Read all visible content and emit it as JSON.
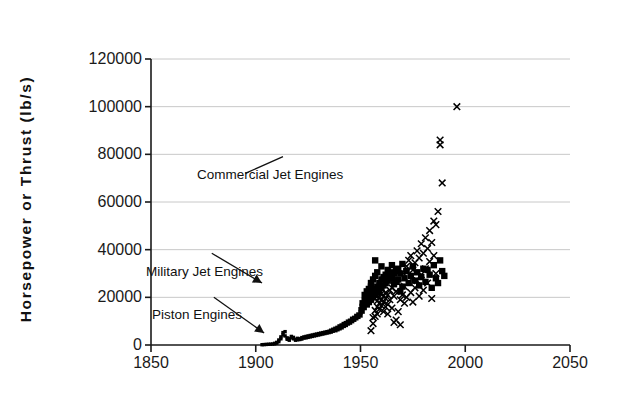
{
  "chart_data": {
    "type": "scatter",
    "title": "",
    "xlabel": "",
    "ylabel": "Horsepower or Thrust (lb/s)",
    "xlim": [
      1850,
      2050
    ],
    "ylim": [
      0,
      120000
    ],
    "xticks": [
      1850,
      1900,
      1950,
      2000,
      2050
    ],
    "yticks": [
      0,
      20000,
      40000,
      60000,
      80000,
      100000,
      120000
    ],
    "xtick_labels": [
      "1850",
      "1900",
      "1950",
      "2000",
      "2050"
    ],
    "ytick_labels": [
      "0",
      "20000",
      "40000",
      "60000",
      "80000",
      "100000",
      "120000"
    ],
    "grid": "horizontal",
    "legend": "none",
    "annotations": [
      {
        "text": "Commercial Jet Engines",
        "x": 1873,
        "y": 72000,
        "arrow_to_x": 1913,
        "arrow_to_y": 79000,
        "arrow_style": "line"
      },
      {
        "text": "Military Jet Engines",
        "x": 1857,
        "y": 38500,
        "arrow_to_x": 1903,
        "arrow_to_y": 26000,
        "arrow_style": "arrow"
      },
      {
        "text": "Piston Engines",
        "x": 1858,
        "y": 20000,
        "arrow_to_x": 1904,
        "arrow_to_y": 5000,
        "arrow_style": "arrow"
      }
    ],
    "series": [
      {
        "name": "Piston and Military Jet Engines",
        "marker": "square",
        "color": "#000000",
        "points": [
          [
            1903,
            120
          ],
          [
            1904,
            180
          ],
          [
            1905,
            240
          ],
          [
            1906,
            300
          ],
          [
            1907,
            350
          ],
          [
            1908,
            420
          ],
          [
            1909,
            500
          ],
          [
            1909,
            700
          ],
          [
            1910,
            800
          ],
          [
            1910,
            1100
          ],
          [
            1911,
            1400
          ],
          [
            1911,
            2100
          ],
          [
            1912,
            2600
          ],
          [
            1912,
            3400
          ],
          [
            1913,
            4200
          ],
          [
            1913,
            5200
          ],
          [
            1914,
            5600
          ],
          [
            1914,
            3800
          ],
          [
            1915,
            3000
          ],
          [
            1915,
            2400
          ],
          [
            1916,
            2000
          ],
          [
            1916,
            2600
          ],
          [
            1917,
            3000
          ],
          [
            1917,
            3600
          ],
          [
            1918,
            3200
          ],
          [
            1918,
            2600
          ],
          [
            1919,
            2400
          ],
          [
            1919,
            2000
          ],
          [
            1920,
            2200
          ],
          [
            1920,
            2800
          ],
          [
            1921,
            2600
          ],
          [
            1921,
            2300
          ],
          [
            1922,
            2500
          ],
          [
            1922,
            3100
          ],
          [
            1923,
            3400
          ],
          [
            1923,
            2900
          ],
          [
            1924,
            3000
          ],
          [
            1924,
            3600
          ],
          [
            1925,
            3800
          ],
          [
            1925,
            3200
          ],
          [
            1926,
            3400
          ],
          [
            1926,
            4000
          ],
          [
            1927,
            4200
          ],
          [
            1927,
            3600
          ],
          [
            1928,
            3800
          ],
          [
            1928,
            4400
          ],
          [
            1929,
            4600
          ],
          [
            1929,
            4000
          ],
          [
            1930,
            4200
          ],
          [
            1930,
            4800
          ],
          [
            1931,
            5000
          ],
          [
            1931,
            4400
          ],
          [
            1932,
            4600
          ],
          [
            1932,
            5200
          ],
          [
            1933,
            5400
          ],
          [
            1933,
            4800
          ],
          [
            1934,
            5000
          ],
          [
            1934,
            5600
          ],
          [
            1935,
            5800
          ],
          [
            1935,
            5200
          ],
          [
            1936,
            5400
          ],
          [
            1936,
            6000
          ],
          [
            1937,
            6400
          ],
          [
            1937,
            5800
          ],
          [
            1938,
            6200
          ],
          [
            1938,
            6800
          ],
          [
            1939,
            7200
          ],
          [
            1939,
            6600
          ],
          [
            1940,
            7000
          ],
          [
            1940,
            7800
          ],
          [
            1941,
            8200
          ],
          [
            1941,
            7400
          ],
          [
            1942,
            8000
          ],
          [
            1942,
            8800
          ],
          [
            1943,
            9200
          ],
          [
            1943,
            8400
          ],
          [
            1944,
            9000
          ],
          [
            1944,
            9800
          ],
          [
            1945,
            10200
          ],
          [
            1945,
            9400
          ],
          [
            1946,
            10000
          ],
          [
            1946,
            11000
          ],
          [
            1947,
            11400
          ],
          [
            1947,
            10600
          ],
          [
            1948,
            11200
          ],
          [
            1948,
            12200
          ],
          [
            1949,
            12800
          ],
          [
            1949,
            11800
          ],
          [
            1950,
            12400
          ],
          [
            1950,
            13600
          ],
          [
            1950,
            15000
          ],
          [
            1951,
            14000
          ],
          [
            1951,
            16000
          ],
          [
            1951,
            17500
          ],
          [
            1952,
            15500
          ],
          [
            1952,
            18500
          ],
          [
            1952,
            21000
          ],
          [
            1953,
            17000
          ],
          [
            1953,
            19500
          ],
          [
            1953,
            22500
          ],
          [
            1954,
            18000
          ],
          [
            1954,
            20500
          ],
          [
            1954,
            23500
          ],
          [
            1955,
            19000
          ],
          [
            1955,
            21500
          ],
          [
            1955,
            24500
          ],
          [
            1955,
            26000
          ],
          [
            1956,
            20000
          ],
          [
            1956,
            22500
          ],
          [
            1956,
            27500
          ],
          [
            1957,
            21000
          ],
          [
            1957,
            23500
          ],
          [
            1957,
            29000
          ],
          [
            1957,
            35500
          ],
          [
            1958,
            22000
          ],
          [
            1958,
            24500
          ],
          [
            1958,
            30500
          ],
          [
            1959,
            23000
          ],
          [
            1959,
            26000
          ],
          [
            1960,
            24000
          ],
          [
            1960,
            27500
          ],
          [
            1960,
            33000
          ],
          [
            1961,
            25000
          ],
          [
            1961,
            28500
          ],
          [
            1962,
            26000
          ],
          [
            1962,
            29500
          ],
          [
            1963,
            27000
          ],
          [
            1963,
            31500
          ],
          [
            1964,
            28000
          ],
          [
            1964,
            30500
          ],
          [
            1965,
            29000
          ],
          [
            1965,
            33500
          ],
          [
            1966,
            30000
          ],
          [
            1966,
            25500
          ],
          [
            1967,
            31000
          ],
          [
            1967,
            26500
          ],
          [
            1968,
            32000
          ],
          [
            1968,
            27500
          ],
          [
            1969,
            30000
          ],
          [
            1969,
            22500
          ],
          [
            1970,
            34000
          ],
          [
            1970,
            24500
          ],
          [
            1971,
            28000
          ],
          [
            1972,
            31000
          ],
          [
            1973,
            26000
          ],
          [
            1974,
            29000
          ],
          [
            1975,
            33000
          ],
          [
            1976,
            27000
          ],
          [
            1977,
            30500
          ],
          [
            1978,
            25000
          ],
          [
            1979,
            28500
          ],
          [
            1980,
            32000
          ],
          [
            1981,
            26500
          ],
          [
            1982,
            31500
          ],
          [
            1983,
            29500
          ],
          [
            1984,
            24000
          ],
          [
            1985,
            33500
          ],
          [
            1986,
            28000
          ],
          [
            1987,
            26000
          ],
          [
            1988,
            35500
          ],
          [
            1989,
            31000
          ],
          [
            1990,
            29000
          ]
        ]
      },
      {
        "name": "Commercial Jet Engines",
        "marker": "x",
        "color": "#000000",
        "points": [
          [
            1955,
            6000
          ],
          [
            1956,
            9000
          ],
          [
            1956,
            11500
          ],
          [
            1957,
            12000
          ],
          [
            1957,
            14500
          ],
          [
            1958,
            13000
          ],
          [
            1958,
            16000
          ],
          [
            1958,
            18500
          ],
          [
            1959,
            15000
          ],
          [
            1959,
            17500
          ],
          [
            1959,
            20000
          ],
          [
            1960,
            16500
          ],
          [
            1960,
            19000
          ],
          [
            1960,
            21500
          ],
          [
            1961,
            18000
          ],
          [
            1961,
            20500
          ],
          [
            1961,
            14000
          ],
          [
            1962,
            19500
          ],
          [
            1962,
            22000
          ],
          [
            1962,
            16000
          ],
          [
            1963,
            21000
          ],
          [
            1963,
            13000
          ],
          [
            1963,
            17000
          ],
          [
            1964,
            23000
          ],
          [
            1964,
            19000
          ],
          [
            1965,
            24000
          ],
          [
            1965,
            15500
          ],
          [
            1966,
            20500
          ],
          [
            1966,
            9500
          ],
          [
            1967,
            22500
          ],
          [
            1967,
            10500
          ],
          [
            1968,
            26000
          ],
          [
            1968,
            14000
          ],
          [
            1969,
            19000
          ],
          [
            1969,
            8500
          ],
          [
            1970,
            30500
          ],
          [
            1970,
            21000
          ],
          [
            1971,
            24500
          ],
          [
            1971,
            17500
          ],
          [
            1972,
            33000
          ],
          [
            1972,
            20000
          ],
          [
            1973,
            35500
          ],
          [
            1973,
            26500
          ],
          [
            1974,
            37500
          ],
          [
            1974,
            22000
          ],
          [
            1975,
            31500
          ],
          [
            1975,
            18000
          ],
          [
            1976,
            34500
          ],
          [
            1976,
            24000
          ],
          [
            1977,
            39500
          ],
          [
            1977,
            27000
          ],
          [
            1978,
            36500
          ],
          [
            1978,
            20500
          ],
          [
            1979,
            42500
          ],
          [
            1979,
            29500
          ],
          [
            1980,
            38500
          ],
          [
            1980,
            23000
          ],
          [
            1981,
            45000
          ],
          [
            1981,
            32000
          ],
          [
            1982,
            40500
          ],
          [
            1982,
            26000
          ],
          [
            1983,
            48000
          ],
          [
            1983,
            35000
          ],
          [
            1984,
            43000
          ],
          [
            1984,
            19500
          ],
          [
            1985,
            52000
          ],
          [
            1985,
            37500
          ],
          [
            1986,
            50500
          ],
          [
            1986,
            30000
          ],
          [
            1987,
            56000
          ],
          [
            1988,
            84000
          ],
          [
            1988,
            86000
          ],
          [
            1989,
            68000
          ],
          [
            1996,
            100000
          ]
        ]
      }
    ]
  },
  "axis": {
    "y_title": "Horsepower or Thrust (lb/s)"
  },
  "annotations": {
    "commercial": "Commercial Jet Engines",
    "military": "Military Jet Engines",
    "piston": "Piston Engines"
  },
  "colors": {
    "axis": "#1a1a1a",
    "grid": "#c8c8c8",
    "marker": "#000000",
    "text": "#111111",
    "background": "#ffffff"
  }
}
